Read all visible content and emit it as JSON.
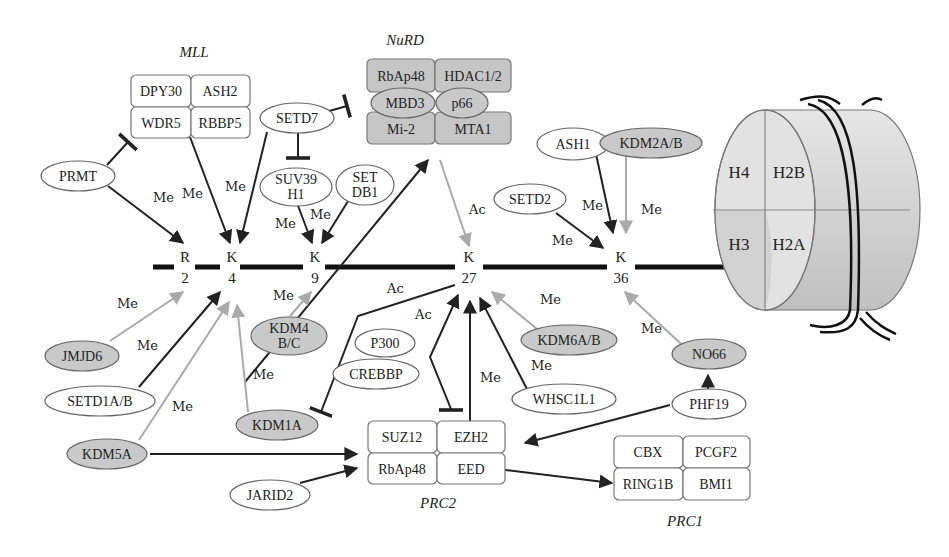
{
  "diagram": {
    "tail": {
      "residues": [
        {
          "id": "R2",
          "aa": "R",
          "pos": "2"
        },
        {
          "id": "K4",
          "aa": "K",
          "pos": "4"
        },
        {
          "id": "K9",
          "aa": "K",
          "pos": "9"
        },
        {
          "id": "K27",
          "aa": "K",
          "pos": "27"
        },
        {
          "id": "K36",
          "aa": "K",
          "pos": "36"
        }
      ]
    },
    "nucleosome": {
      "histones": [
        "H4",
        "H2B",
        "H3",
        "H2A"
      ]
    },
    "complexes": {
      "mll": {
        "title": "MLL",
        "members": [
          "DPY30",
          "ASH2",
          "WDR5",
          "RBBP5"
        ]
      },
      "nurd": {
        "title": "NuRD",
        "members": [
          "RbAp48",
          "HDAC1/2",
          "MBD3",
          "p66",
          "Mi-2",
          "MTA1"
        ]
      },
      "prc2": {
        "title": "PRC2",
        "members": [
          "SUZ12",
          "EZH2",
          "RbAp48",
          "EED"
        ]
      },
      "prc1": {
        "title": "PRC1",
        "members": [
          "CBX",
          "PCGF2",
          "RING1B",
          "BMI1"
        ]
      }
    },
    "writers": [
      "PRMT",
      "SETD7",
      "SUV39 H1",
      "SET DB1",
      "ASH1",
      "SETD2",
      "SETD1A/B",
      "P300",
      "CREBBP",
      "WHSC1L1",
      "PHF19",
      "JARID2"
    ],
    "erasers": [
      "KDM2A/B",
      "JMJD6",
      "KDM4 B/C",
      "KDM1A",
      "KDM5A",
      "KDM6A/B",
      "NO66"
    ],
    "nodes": {
      "prmt": [
        "PRMT"
      ],
      "setd7": [
        "SETD7"
      ],
      "suv39": [
        "SUV39",
        "H1"
      ],
      "setdb1": [
        "SET",
        "DB1"
      ],
      "ash1": [
        "ASH1"
      ],
      "kdm2ab": [
        "KDM2A/B"
      ],
      "setd2": [
        "SETD2"
      ],
      "jmjd6": [
        "JMJD6"
      ],
      "setd1ab": [
        "SETD1A/B"
      ],
      "kdm5a": [
        "KDM5A"
      ],
      "kdm4bc": [
        "KDM4",
        "B/C"
      ],
      "kdm1a": [
        "KDM1A"
      ],
      "p300": [
        "P300"
      ],
      "crebbp": [
        "CREBBP"
      ],
      "kdm6ab": [
        "KDM6A/B"
      ],
      "whsc1l1": [
        "WHSC1L1"
      ],
      "no66": [
        "NO66"
      ],
      "phf19": [
        "PHF19"
      ],
      "jarid2": [
        "JARID2"
      ]
    },
    "edge_labels": {
      "me": "Me",
      "ac": "Ac"
    }
  }
}
